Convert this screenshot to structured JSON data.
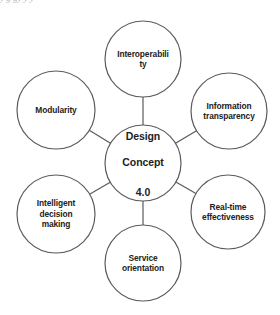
{
  "header": {
    "cropped_caption": "y            g         gy  y                                 y"
  },
  "colors": {
    "stroke": "#5a5a5a",
    "text": "#222222",
    "background": "#ffffff"
  },
  "center": {
    "id": "design-concept",
    "label_line1": "Design",
    "label_line2": "Concept",
    "label_line3": "4.0",
    "cx": 143,
    "cy": 163,
    "r": 38
  },
  "nodes": [
    {
      "id": "interoperability",
      "label": "Interoperabili\nty",
      "cx": 143,
      "cy": 59,
      "r": 38
    },
    {
      "id": "information-transparency",
      "label": "Information\ntransparency",
      "cx": 229,
      "cy": 111,
      "r": 38
    },
    {
      "id": "real-time-effectiveness",
      "label": "Real-time\neffectiveness",
      "cx": 228,
      "cy": 212,
      "r": 37
    },
    {
      "id": "service-orientation",
      "label": "Service\norientation",
      "cx": 143,
      "cy": 263,
      "r": 38
    },
    {
      "id": "intelligent-decision-making",
      "label": "Intelligent\ndecision\nmaking",
      "cx": 56,
      "cy": 214,
      "r": 39
    },
    {
      "id": "modularity",
      "label": "Modularity",
      "cx": 56,
      "cy": 110,
      "r": 39
    }
  ]
}
